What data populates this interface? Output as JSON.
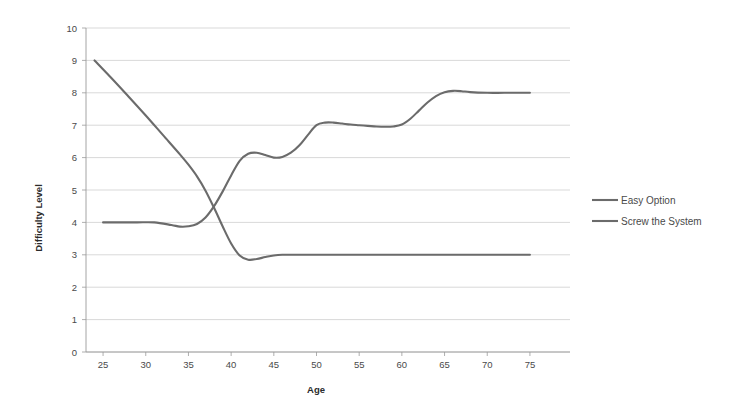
{
  "chart_data": {
    "type": "line",
    "title": "",
    "xlabel": "Age",
    "ylabel": "Difficulty Level",
    "xlim": [
      23,
      77
    ],
    "ylim": [
      0,
      10
    ],
    "grid": "horizontal",
    "legend_position": "right",
    "x_ticks": [
      25,
      30,
      35,
      40,
      45,
      50,
      55,
      60,
      65,
      70,
      75
    ],
    "y_ticks": [
      0,
      1,
      2,
      3,
      4,
      5,
      6,
      7,
      8,
      9,
      10
    ],
    "series": [
      {
        "name": "Easy Option",
        "color": "#6b6b6b",
        "x": [
          25,
          27,
          29,
          31,
          33,
          34,
          35,
          36,
          37,
          38,
          39,
          40,
          41,
          42,
          43,
          44,
          45,
          46,
          47,
          48,
          49,
          50,
          51,
          52,
          53,
          54,
          55,
          56,
          57,
          58,
          59,
          60,
          61,
          62,
          63,
          64,
          65,
          66,
          67,
          68,
          70,
          72,
          75
        ],
        "y": [
          4.0,
          4.0,
          4.0,
          4.0,
          3.92,
          3.87,
          3.88,
          3.95,
          4.15,
          4.5,
          4.95,
          5.45,
          5.9,
          6.12,
          6.15,
          6.08,
          6.0,
          6.02,
          6.15,
          6.38,
          6.7,
          7.0,
          7.08,
          7.08,
          7.05,
          7.02,
          7.0,
          6.98,
          6.96,
          6.95,
          6.96,
          7.02,
          7.2,
          7.45,
          7.7,
          7.9,
          8.02,
          8.06,
          8.05,
          8.02,
          8.0,
          8.0,
          8.0
        ]
      },
      {
        "name": "Screw the System",
        "color": "#6b6b6b",
        "x": [
          24,
          26,
          28,
          30,
          32,
          34,
          35,
          36,
          37,
          38,
          39,
          40,
          41,
          42,
          43,
          44,
          45,
          46,
          48,
          50,
          55,
          60,
          65,
          70,
          75
        ],
        "y": [
          9.0,
          8.45,
          7.88,
          7.3,
          6.7,
          6.1,
          5.78,
          5.42,
          4.98,
          4.45,
          3.88,
          3.35,
          2.98,
          2.85,
          2.87,
          2.93,
          2.98,
          3.0,
          3.0,
          3.0,
          3.0,
          3.0,
          3.0,
          3.0,
          3.0
        ]
      }
    ],
    "annotations": {
      "crossover_age": 36.5,
      "crossover_level": 4.3
    }
  },
  "legend": {
    "items": [
      {
        "label": "Easy Option"
      },
      {
        "label": "Screw the System"
      }
    ]
  },
  "axes": {
    "x_title": "Age",
    "y_title": "Difficulty Level"
  }
}
